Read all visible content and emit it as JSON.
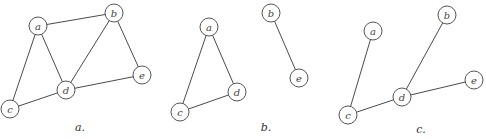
{
  "figure": {
    "node_radius": 9,
    "stroke_color": "#4a4a4a",
    "graphs": [
      {
        "id": "a",
        "caption": "a.",
        "caption_pos": [
          80,
          131
        ],
        "nodes": {
          "a": [
            38,
            26
          ],
          "b": [
            114,
            13
          ],
          "c": [
            10,
            109
          ],
          "d": [
            66,
            90
          ],
          "e": [
            142,
            75
          ]
        },
        "edges": [
          [
            "a",
            "b"
          ],
          [
            "a",
            "c"
          ],
          [
            "a",
            "d"
          ],
          [
            "b",
            "d"
          ],
          [
            "b",
            "e"
          ],
          [
            "c",
            "d"
          ],
          [
            "d",
            "e"
          ]
        ]
      },
      {
        "id": "b",
        "caption": "b.",
        "caption_pos": [
          266,
          131
        ],
        "nodes": {
          "a": [
            209,
            27
          ],
          "c": [
            180,
            112
          ],
          "d": [
            237,
            92
          ],
          "b": [
            271,
            13
          ],
          "e": [
            299,
            78
          ]
        },
        "edges": [
          [
            "a",
            "c"
          ],
          [
            "a",
            "d"
          ],
          [
            "c",
            "d"
          ],
          [
            "b",
            "e"
          ]
        ]
      },
      {
        "id": "c",
        "caption": "c.",
        "caption_pos": [
          421,
          133
        ],
        "nodes": {
          "a": [
            373,
            31
          ],
          "b": [
            447,
            15
          ],
          "c": [
            348,
            115
          ],
          "d": [
            402,
            97
          ],
          "e": [
            474,
            80
          ]
        },
        "edges": [
          [
            "a",
            "c"
          ],
          [
            "c",
            "d"
          ],
          [
            "b",
            "d"
          ],
          [
            "d",
            "e"
          ]
        ]
      }
    ]
  }
}
